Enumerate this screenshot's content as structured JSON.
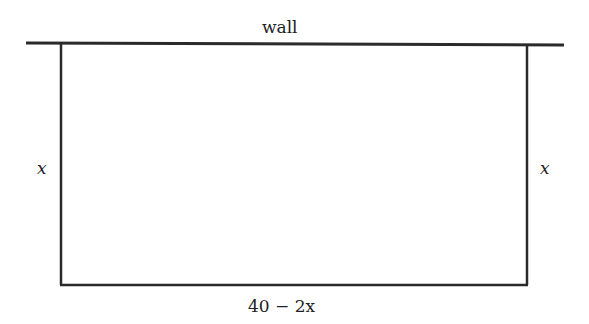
{
  "diagram": {
    "type": "fenced-rectangle-against-wall",
    "labels": {
      "wall": "wall",
      "left_side": "x",
      "right_side": "x",
      "bottom_side": "40 − 2x"
    },
    "colors": {
      "stroke": "#2a2a2a",
      "text": "#222222",
      "background": "#ffffff"
    }
  }
}
